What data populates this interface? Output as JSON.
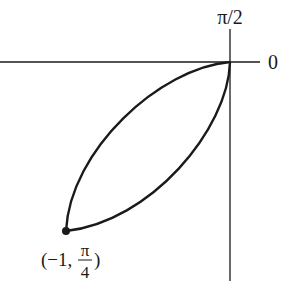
{
  "diagram": {
    "type": "polar-curve-sketch",
    "axes": {
      "polar_axis_label": "0",
      "vertical_axis_label": "π/2"
    },
    "point": {
      "label_r": "(−1, ",
      "label_theta_num": "π",
      "label_theta_den": "4",
      "label_close": ")",
      "r": -1,
      "theta": "π/4"
    },
    "colors": {
      "stroke": "#1a1a1a",
      "background": "#ffffff"
    }
  }
}
